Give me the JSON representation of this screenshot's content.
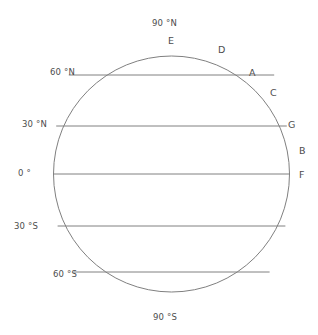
{
  "diagram": {
    "type": "globe-latitude-diagram",
    "stroke_color": "#808080",
    "text_color": "#4d4d4d",
    "background_color": "#ffffff",
    "circle": {
      "cx": 171.5,
      "cy": 174,
      "r": 118
    },
    "latitude_labels": [
      {
        "id": "lat-90n",
        "text": "90 °N",
        "x": 152,
        "y": 19,
        "align": "center"
      },
      {
        "id": "lat-60n",
        "text": "60 °N",
        "x": 50,
        "y": 68,
        "align": "left"
      },
      {
        "id": "lat-30n",
        "text": "30 °N",
        "x": 22,
        "y": 120,
        "align": "left"
      },
      {
        "id": "lat-0",
        "text": "0 °",
        "x": 18,
        "y": 169,
        "align": "left"
      },
      {
        "id": "lat-30s",
        "text": "30 °S",
        "x": 14,
        "y": 222,
        "align": "left"
      },
      {
        "id": "lat-60s",
        "text": "60 °S",
        "x": 53,
        "y": 270,
        "align": "left"
      },
      {
        "id": "lat-90s",
        "text": "90 °S",
        "x": 153,
        "y": 313,
        "align": "center"
      }
    ],
    "latitude_lines": [
      {
        "id": "line-60n",
        "label": "60 °N",
        "y": 75
      },
      {
        "id": "line-30n",
        "label": "30 °N",
        "y": 126
      },
      {
        "id": "line-0",
        "label": "0 °",
        "y": 174
      },
      {
        "id": "line-30s",
        "label": "30 °S",
        "y": 226
      },
      {
        "id": "line-60s",
        "label": "60 °S",
        "y": 272
      }
    ],
    "point_labels": [
      {
        "id": "point-e",
        "text": "E",
        "x": 168,
        "y": 36
      },
      {
        "id": "point-d",
        "text": "D",
        "x": 218,
        "y": 45
      },
      {
        "id": "point-a",
        "text": "A",
        "x": 249,
        "y": 68
      },
      {
        "id": "point-c",
        "text": "C",
        "x": 270,
        "y": 88
      },
      {
        "id": "point-g",
        "text": "G",
        "x": 288,
        "y": 120
      },
      {
        "id": "point-b",
        "text": "B",
        "x": 299,
        "y": 146
      },
      {
        "id": "point-f",
        "text": "F",
        "x": 299,
        "y": 170
      }
    ]
  }
}
